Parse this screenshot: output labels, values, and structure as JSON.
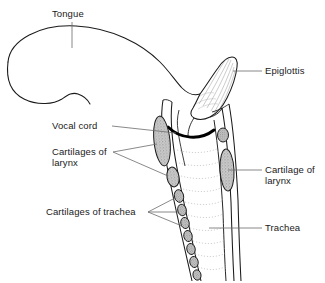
{
  "figure": {
    "type": "anatomical-diagram",
    "background_color": "#ffffff",
    "line_color": "#1a1a1a",
    "cartilage_fill": "#b9b9b9",
    "vocal_cord_color": "#000000"
  },
  "labels": {
    "tongue": "Tongue",
    "epiglottis": "Epiglottis",
    "vocal_cord": "Vocal cord",
    "cartilages_of_larynx_line1": "Cartilages of",
    "cartilages_of_larynx_line2": "larynx",
    "cartilage_of_larynx_line1": "Cartilage of",
    "cartilage_of_larynx_line2": "larynx",
    "cartilages_of_trachea": "Cartilages of trachea",
    "trachea": "Trachea"
  },
  "structures": [
    {
      "name": "tongue",
      "side": "left"
    },
    {
      "name": "epiglottis",
      "side": "right"
    },
    {
      "name": "vocal-cord",
      "side": "center"
    },
    {
      "name": "laryngeal-cartilage-anterior",
      "side": "left"
    },
    {
      "name": "laryngeal-cartilage-posterior",
      "side": "right"
    },
    {
      "name": "tracheal-cartilage-rings",
      "side": "left"
    },
    {
      "name": "trachea",
      "side": "center"
    }
  ]
}
